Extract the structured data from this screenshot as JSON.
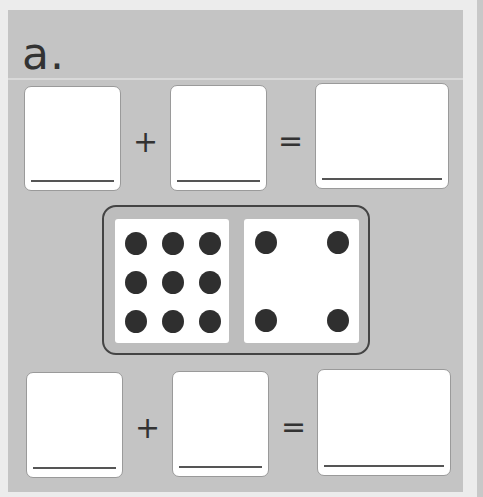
{
  "exercise": {
    "label": "a.",
    "top_equation": {
      "addend1": "",
      "plus": "+",
      "addend2": "",
      "equals": "=",
      "sum": ""
    },
    "bottom_equation": {
      "addend1": "",
      "plus": "+",
      "addend2": "",
      "equals": "=",
      "sum": ""
    },
    "domino": {
      "left_pips": 9,
      "right_pips": 4
    }
  },
  "colors": {
    "panel": "#c4c4c4",
    "background": "#ececec",
    "pip": "#2f2f2f",
    "domino_border": "#444444"
  }
}
